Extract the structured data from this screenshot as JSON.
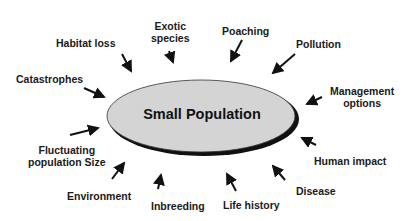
{
  "diagram": {
    "center": {
      "label": "Small Population",
      "fill": "#d4d4d4",
      "shadow": "#111111"
    },
    "factors": [
      {
        "id": "habitat-loss",
        "label": "Habitat loss"
      },
      {
        "id": "exotic-species",
        "label": "Exotic species",
        "lines": [
          "Exotic",
          "species"
        ]
      },
      {
        "id": "poaching",
        "label": "Poaching"
      },
      {
        "id": "pollution",
        "label": "Pollution"
      },
      {
        "id": "catastrophes",
        "label": "Catastrophes"
      },
      {
        "id": "management-options",
        "label": "Management options",
        "lines": [
          "Management",
          "options"
        ]
      },
      {
        "id": "fluctuating-population-size",
        "label": "Fluctuating population Size",
        "lines": [
          "Fluctuating",
          "population Size"
        ]
      },
      {
        "id": "human-impact",
        "label": "Human impact"
      },
      {
        "id": "environment",
        "label": "Environment"
      },
      {
        "id": "inbreeding",
        "label": "Inbreeding"
      },
      {
        "id": "life-history",
        "label": "Life history"
      },
      {
        "id": "disease",
        "label": "Disease"
      }
    ]
  }
}
